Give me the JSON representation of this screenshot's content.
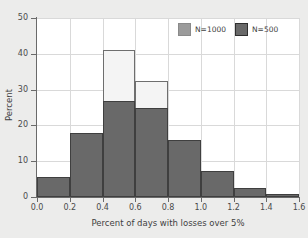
{
  "chart_data": {
    "type": "bar",
    "title": "",
    "subtitle": "",
    "xlabel": "Percent of days with losses over 5%",
    "ylabel": "Percent",
    "xlim": [
      0.0,
      1.6
    ],
    "ylim": [
      0,
      50
    ],
    "grid": true,
    "legend_position": "top-right",
    "bin_width": 0.2,
    "bin_edges": [
      0.0,
      0.2,
      0.4,
      0.6,
      0.8,
      1.0,
      1.2,
      1.4,
      1.6
    ],
    "categories": [
      "0.0-0.2",
      "0.2-0.4",
      "0.4-0.6",
      "0.6-0.8",
      "0.8-1.0",
      "1.0-1.2",
      "1.2-1.4",
      "1.4-1.6"
    ],
    "x_ticks": [
      "0.0",
      "0.2",
      "0.4",
      "0.6",
      "0.8",
      "1.0",
      "1.2",
      "1.4",
      "1.6"
    ],
    "x_tick_values": [
      0.0,
      0.2,
      0.4,
      0.6,
      0.8,
      1.0,
      1.2,
      1.4,
      1.6
    ],
    "y_ticks": [
      "0",
      "10",
      "20",
      "30",
      "40",
      "50"
    ],
    "y_tick_values": [
      0,
      10,
      20,
      30,
      40,
      50
    ],
    "series": [
      {
        "name": "N=1000",
        "color": "#f4f4f4",
        "edge_color": "#6e6e6e",
        "values": [
          5.6,
          18.0,
          41.2,
          32.3,
          16.0,
          7.2,
          2.5,
          0.8
        ]
      },
      {
        "name": "N=500",
        "color": "#696969",
        "edge_color": "#3f3f3f",
        "values": [
          5.6,
          18.0,
          26.8,
          25.0,
          16.0,
          7.2,
          2.5,
          0.8
        ]
      }
    ]
  },
  "legend": {
    "entries": [
      {
        "label": "N=1000",
        "swatch": "light-gray-swatch"
      },
      {
        "label": "N=500",
        "swatch": "dark-gray-swatch"
      }
    ]
  },
  "axes": {
    "x_title": "Percent of days with losses over 5%",
    "y_title": "Percent"
  },
  "colors": {
    "page_background": "#ececeb",
    "plot_background": "#ffffff",
    "gridline": "#d9d9d9",
    "axis": "#6a6a6a",
    "series_light": "#f4f4f4",
    "series_dark": "#696969",
    "text": "#3f3f3f"
  }
}
